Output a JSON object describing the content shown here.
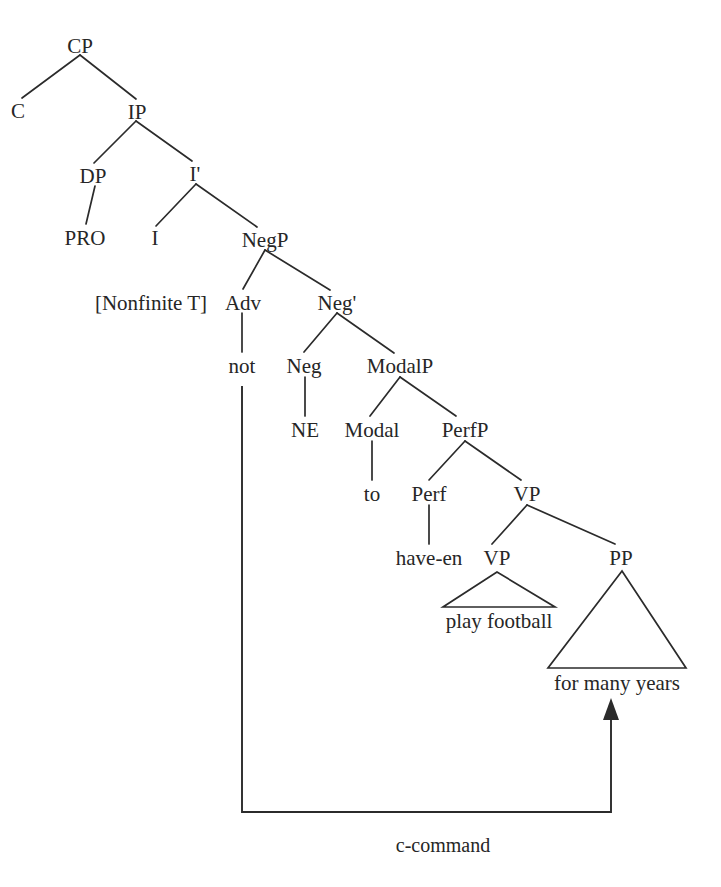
{
  "figure": {
    "kind": "syntax-tree",
    "caption": "",
    "ink_color": "#2b2b2b",
    "background_color": "#ffffff"
  },
  "nodes": {
    "cp": "CP",
    "c": "C",
    "ip": "IP",
    "dp": "DP",
    "ibar": "I'",
    "pro": "PRO",
    "i": "I",
    "negp": "NegP",
    "adv": "Adv",
    "negbar": "Neg'",
    "not": "not",
    "neg": "Neg",
    "modalp": "ModalP",
    "ne": "NE",
    "modal": "Modal",
    "perfp": "PerfP",
    "to": "to",
    "perf": "Perf",
    "vp_upper": "VP",
    "have_en": "have-en",
    "vp_lower": "VP",
    "pp": "PP",
    "play_football": "play football",
    "for_many_years": "for many years"
  },
  "features": {
    "nonfinite_t": "[Nonfinite T]"
  },
  "annotations": {
    "ccommand": "c-command"
  }
}
